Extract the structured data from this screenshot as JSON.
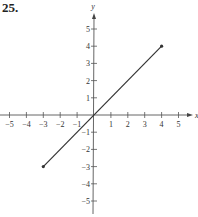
{
  "problem_number": "25.",
  "chart_data": {
    "type": "line",
    "title": "",
    "xlabel": "x",
    "ylabel": "y",
    "xlim": [
      -5,
      5
    ],
    "ylim": [
      -5,
      5
    ],
    "xticks": [
      -5,
      -4,
      -3,
      -2,
      -1,
      1,
      2,
      3,
      4,
      5
    ],
    "yticks": [
      -5,
      -4,
      -3,
      -2,
      -1,
      1,
      2,
      3,
      4,
      5
    ],
    "xtick_labels": [
      "−5",
      "−4",
      "−3",
      "−2",
      "−1",
      "1",
      "2",
      "3",
      "4",
      "5"
    ],
    "ytick_labels": [
      "−5",
      "−4",
      "−3",
      "−2",
      "−1",
      "1",
      "2",
      "3",
      "4",
      "5"
    ],
    "grid": false,
    "series": [
      {
        "name": "segment",
        "x": [
          -3,
          4
        ],
        "y": [
          -3,
          4
        ],
        "endpoints": "closed",
        "color": "#333333"
      }
    ]
  }
}
